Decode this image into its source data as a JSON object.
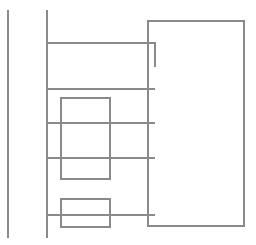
{
  "diagram": {
    "width": 256,
    "height": 245,
    "background": "#ffffff",
    "stroke_color": "#8a8a8a",
    "stroke_width": 1.3,
    "rails": [
      {
        "id": "left-rail",
        "x": 8,
        "y1": 10,
        "y2": 238
      },
      {
        "id": "bus-rail",
        "x": 47,
        "y1": 10,
        "y2": 238
      }
    ],
    "rungs": [
      {
        "id": "rung-1",
        "y": 43,
        "x1": 47,
        "x2": 155,
        "drop_to_y": 67
      },
      {
        "id": "rung-2",
        "y": 89,
        "x1": 47,
        "x2": 155
      },
      {
        "id": "rung-3",
        "y": 123,
        "x1": 47,
        "x2": 155
      },
      {
        "id": "rung-4",
        "y": 158,
        "x1": 47,
        "x2": 155
      },
      {
        "id": "rung-5",
        "y": 215,
        "x1": 47,
        "x2": 155
      }
    ],
    "boxes": [
      {
        "id": "right-panel",
        "x": 148,
        "y": 21,
        "w": 96,
        "h": 205
      },
      {
        "id": "inner-box-1",
        "x": 61,
        "y": 98,
        "w": 49,
        "h": 81
      },
      {
        "id": "inner-box-2",
        "x": 61,
        "y": 199,
        "w": 49,
        "h": 28
      }
    ]
  }
}
